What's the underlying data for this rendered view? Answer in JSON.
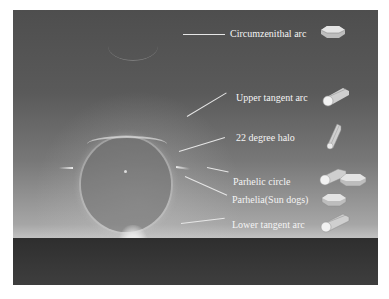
{
  "diagram": {
    "labels": [
      {
        "id": "circumzenithal",
        "text": "Circumzenithal arc",
        "crystal": "plate-crystal"
      },
      {
        "id": "upper-tangent",
        "text": "Upper tangent arc",
        "crystal": "column-crystal"
      },
      {
        "id": "halo22",
        "text": "22 degree halo",
        "crystal": "column-crystal-tilted"
      },
      {
        "id": "parhelic-circle",
        "text": "Parhelic circle",
        "crystal": "column-and-plate-crystals"
      },
      {
        "id": "parhelia",
        "text": "Parhelia(Sun dogs)",
        "crystal": "plate-crystal"
      },
      {
        "id": "lower-tangent",
        "text": "Lower tangent arc",
        "crystal": "column-crystal"
      }
    ]
  },
  "colors": {
    "sky_top": "#4e4e4e",
    "sky_horizon": "#c2c2c2",
    "ground": "#333333",
    "label_text": "#f4f4f4",
    "crystal_fill": "#d8d8d8"
  }
}
